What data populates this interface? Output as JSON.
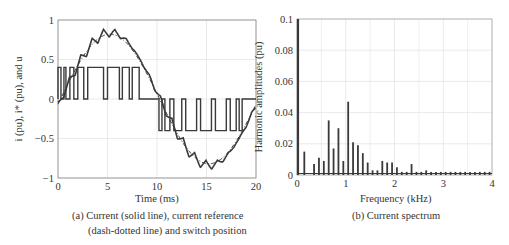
{
  "chart_data": [
    {
      "type": "line",
      "title": "",
      "xlabel": "Time (ms)",
      "ylabel": "i (pu), i* (pu), and u",
      "xlim": [
        0,
        20
      ],
      "ylim": [
        -1,
        1
      ],
      "xticks": [
        0,
        5,
        10,
        15,
        20
      ],
      "yticks": [
        -1,
        -0.5,
        0,
        0.5,
        1
      ],
      "ytick_labels": [
        "−1",
        "−0.5",
        "0",
        "0.5",
        "1"
      ],
      "grid": true,
      "series": [
        {
          "name": "Current i (solid line)",
          "style": "solid",
          "description": "Sinusoidal current 50 Hz amplitude ~0.85 pu with PWM ripple ~0.1 pu"
        },
        {
          "name": "Current reference i* (dash-dotted line)",
          "style": "dash-dot",
          "description": "Sinusoid amplitude ~0.8 pu, 50 Hz"
        },
        {
          "name": "Switch position u",
          "style": "solid",
          "description": "Three-level switch: 0.4 / 0 in first half cycle, 0 / -0.4 in second half cycle",
          "values_scaled": [
            0.4,
            0,
            -0.4
          ]
        }
      ],
      "caption": "(a) Current (solid line), current reference (dash-dotted line) and switch position"
    },
    {
      "type": "bar",
      "title": "",
      "xlabel": "Frequency (kHz)",
      "ylabel": "Harmonic amplitudes (pu)",
      "xlim": [
        0,
        4
      ],
      "ylim": [
        0,
        0.1
      ],
      "xticks": [
        0,
        1,
        2,
        3,
        4
      ],
      "yticks": [
        0,
        0.02,
        0.04,
        0.06,
        0.08,
        0.1
      ],
      "ytick_labels": [
        "0",
        "0.02",
        "0.04",
        "0.06",
        "0.08",
        "0.1"
      ],
      "grid": true,
      "x": [
        0.05,
        0.15,
        0.35,
        0.45,
        0.55,
        0.65,
        0.75,
        0.85,
        0.95,
        1.05,
        1.15,
        1.25,
        1.35,
        1.45,
        1.55,
        1.65,
        1.75,
        1.85,
        1.95,
        2.05,
        2.15,
        2.25,
        2.35,
        2.45,
        2.55,
        2.65,
        2.75,
        2.85,
        2.95,
        3.05,
        3.15,
        3.25,
        3.35,
        3.45,
        3.55,
        3.65,
        3.75,
        3.85,
        3.95
      ],
      "values": [
        0.1,
        0.015,
        0.007,
        0.011,
        0.009,
        0.035,
        0.017,
        0.03,
        0.009,
        0.047,
        0.021,
        0.019,
        0.014,
        0.008,
        0.003,
        0.003,
        0.009,
        0.008,
        0.008,
        0.005,
        0.002,
        0.002,
        0.007,
        0.002,
        0.002,
        0.003,
        0.002,
        0.002,
        0.002,
        0.002,
        0.002,
        0.002,
        0.002,
        0.002,
        0.002,
        0.002,
        0.002,
        0.002,
        0.002
      ],
      "caption": "(b) Current spectrum"
    }
  ],
  "left": {
    "xlabel": "Time (ms)",
    "caption_line1": "(a) Current (solid line), current reference",
    "caption_line2": "(dash-dotted line) and switch position",
    "ylabel": "i (pu), i* (pu), and u"
  },
  "right": {
    "xlabel": "Frequency (kHz)",
    "caption": "(b)  Current spectrum",
    "ylabel": "Harmonic amplitudes (pu)"
  },
  "colors": {
    "line": "#3a3a3a",
    "grid": "#e4e4e4",
    "axis": "#555555"
  }
}
